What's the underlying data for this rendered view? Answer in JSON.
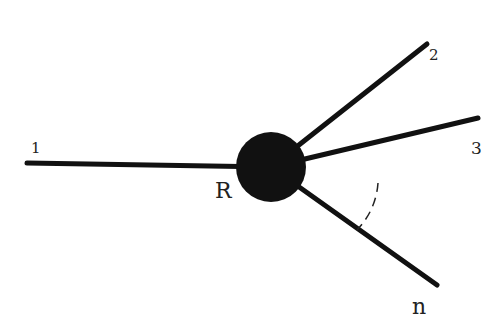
{
  "diagram": {
    "type": "star-graph",
    "background": "#ffffff",
    "line_color": "#111111",
    "node": {
      "label": "R",
      "color": "#111111",
      "cx": 271,
      "cy": 167,
      "r": 35
    },
    "edges": [
      {
        "id": "1",
        "label": "1",
        "x2": 27,
        "y2": 163
      },
      {
        "id": "2",
        "label": "2",
        "x2": 427,
        "y2": 44
      },
      {
        "id": "3",
        "label": "3",
        "x2": 478,
        "y2": 118
      },
      {
        "id": "n",
        "label": "n",
        "x2": 437,
        "y2": 285
      }
    ],
    "angle_arc": {
      "between": [
        "3",
        "n"
      ],
      "style": "dashed"
    },
    "labels": {
      "node": "R",
      "edge_1": "1",
      "edge_2": "2",
      "edge_3": "3",
      "edge_n": "n"
    }
  }
}
